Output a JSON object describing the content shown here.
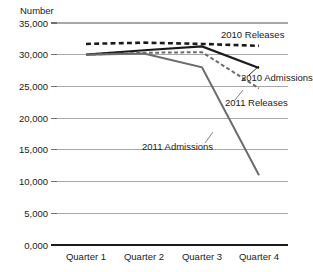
{
  "chart_data": {
    "type": "line",
    "title": "",
    "subtitle": "",
    "ylabel": "Number",
    "xlabel": "",
    "categories": [
      "Quarter 1",
      "Quarter 2",
      "Quarter 3",
      "Quarter 4"
    ],
    "yticks": [
      "0,000",
      "5,000",
      "10,000",
      "15,000",
      "20,000",
      "25,000",
      "30,000",
      "35,000"
    ],
    "ytick_values": [
      0,
      5000,
      10000,
      15000,
      20000,
      25000,
      30000,
      35000
    ],
    "ylim": [
      0,
      35000
    ],
    "grid": "horizontal",
    "legend": "inline-annotations",
    "series": [
      {
        "name": "2010 Releases",
        "values": [
          31700,
          31900,
          31700,
          31400
        ],
        "style": "dashed",
        "color": "#1a1a1a",
        "width": 2.6,
        "label_x": 221,
        "label_y": 38,
        "label_anchor": "start"
      },
      {
        "name": "2010 Admissions",
        "values": [
          30000,
          30700,
          31300,
          27900
        ],
        "style": "solid",
        "color": "#1a1a1a",
        "width": 2.2,
        "label_x": 241,
        "label_y": 81,
        "label_anchor": "start"
      },
      {
        "name": "2011 Releases",
        "values": [
          30000,
          30300,
          30400,
          24700
        ],
        "style": "dashed",
        "color": "#6b6b6b",
        "width": 2.0,
        "label_x": 225,
        "label_y": 106,
        "label_anchor": "start"
      },
      {
        "name": "2011 Admissions",
        "values": [
          30000,
          30200,
          28000,
          11000
        ],
        "style": "solid",
        "color": "#6b6b6b",
        "width": 2.0,
        "label_x": 142,
        "label_y": 150,
        "label_anchor": "start"
      }
    ],
    "axis_geometry": {
      "plot_left": 57,
      "plot_right": 288,
      "plot_top": 23,
      "plot_bottom": 245,
      "category_centers": [
        86,
        144,
        202,
        259
      ]
    }
  }
}
